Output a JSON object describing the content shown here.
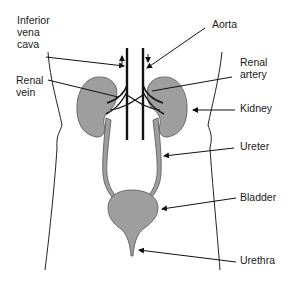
{
  "diagram": {
    "colors": {
      "organ_fill": "#9e9e9e",
      "line": "#111111",
      "background": "#ffffff"
    },
    "labels": [
      {
        "id": "inferior-vena-cava",
        "text": "Inferior\nvena\ncava"
      },
      {
        "id": "aorta",
        "text": "Aorta"
      },
      {
        "id": "renal-vein",
        "text": "Renal\nvein"
      },
      {
        "id": "renal-artery",
        "text": "Renal\nartery"
      },
      {
        "id": "kidney",
        "text": "Kidney"
      },
      {
        "id": "ureter",
        "text": "Ureter"
      },
      {
        "id": "bladder",
        "text": "Bladder"
      },
      {
        "id": "urethra",
        "text": "Urethra"
      }
    ]
  }
}
